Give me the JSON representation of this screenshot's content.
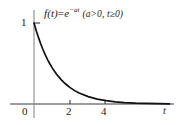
{
  "figure": {
    "background_color": "#ffffff",
    "axis_color": "#3a3a3a",
    "curve_color": "#111111"
  },
  "annotation": {
    "function_lhs": "f(t)",
    "equals": "=",
    "base": "e",
    "exponent": "−at",
    "conditions": "(a>0, t≥0)",
    "full_text": "f(t) = e−at (a>0, t≥0)"
  },
  "axes": {
    "x_name": "t",
    "origin_label": "0",
    "y_tick_label": "1",
    "x_tick_labels": [
      "2",
      "4"
    ]
  },
  "chart_data": {
    "type": "line",
    "title": "",
    "subtitle": "",
    "xlabel": "t",
    "ylabel": "",
    "annotations": [
      "f(t) = e^(-at)  (a>0, t≥0)"
    ],
    "legend": [],
    "legend_position": "none",
    "grid": false,
    "xlim": [
      0,
      6.2
    ],
    "ylim": [
      0,
      1.18
    ],
    "xticks": [
      2,
      4
    ],
    "yticks": [
      1
    ],
    "series": [
      {
        "name": "f(t) = e^(-at)",
        "equation": "y = exp(-a*t)",
        "a": 1.0,
        "x": [
          0,
          0.1,
          0.2,
          0.3,
          0.4,
          0.5,
          0.6,
          0.7,
          0.8,
          0.9,
          1.0,
          1.2,
          1.4,
          1.6,
          1.8,
          2.0,
          2.4,
          2.8,
          3.2,
          3.6,
          4.0,
          4.5,
          5.0,
          5.5,
          6.0
        ],
        "y": [
          1.0,
          0.905,
          0.819,
          0.741,
          0.67,
          0.607,
          0.549,
          0.497,
          0.449,
          0.407,
          0.368,
          0.301,
          0.247,
          0.202,
          0.165,
          0.135,
          0.091,
          0.061,
          0.041,
          0.027,
          0.018,
          0.011,
          0.007,
          0.004,
          0.002
        ]
      }
    ]
  }
}
